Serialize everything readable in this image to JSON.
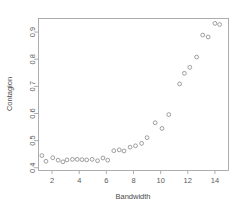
{
  "chart_data": {
    "type": "scatter",
    "title": "",
    "xlabel": "Bandwidth",
    "ylabel": "Contagion",
    "xlim": [
      1.0,
      15.0
    ],
    "ylim": [
      0.39,
      0.95
    ],
    "xticks": [
      2,
      4,
      6,
      8,
      10,
      12,
      14
    ],
    "xtick_labels": [
      "2",
      "4",
      "6",
      "8",
      "10",
      "12",
      "14"
    ],
    "yticks": [
      0.4,
      0.5,
      0.6,
      0.7,
      0.8,
      0.9
    ],
    "ytick_labels": [
      "0.4",
      "0.5",
      "0.6",
      "0.7",
      "0.8",
      "0.9"
    ],
    "grid": false,
    "legend": false,
    "marker": "open-circle",
    "marker_color": "#8c8c8c",
    "frame_color": "#9a9a9a",
    "background": "#ffffff",
    "x": [
      1.25,
      1.55,
      2.05,
      2.45,
      2.8,
      3.1,
      3.5,
      3.85,
      4.2,
      4.55,
      4.95,
      5.35,
      5.75,
      6.1,
      6.55,
      6.95,
      7.3,
      7.75,
      8.15,
      8.6,
      9.0,
      9.6,
      10.1,
      10.6,
      11.4,
      11.75,
      12.15,
      12.65,
      13.1,
      13.5,
      14.0,
      14.35
    ],
    "y": [
      0.445,
      0.424,
      0.437,
      0.428,
      0.422,
      0.429,
      0.431,
      0.431,
      0.43,
      0.429,
      0.431,
      0.426,
      0.436,
      0.428,
      0.463,
      0.466,
      0.462,
      0.476,
      0.481,
      0.49,
      0.511,
      0.566,
      0.545,
      0.596,
      0.709,
      0.748,
      0.77,
      0.808,
      0.889,
      0.882,
      0.932,
      0.928
    ]
  },
  "axis": {
    "x_title": "Bandwidth",
    "y_title": "Contagion"
  }
}
